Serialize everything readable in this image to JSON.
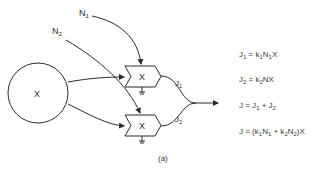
{
  "diagram": {
    "source_node": {
      "label": "X"
    },
    "inputs": [
      {
        "label": "N",
        "sub": "1"
      },
      {
        "label": "N",
        "sub": "2"
      }
    ],
    "multipliers": [
      {
        "label": "X"
      },
      {
        "label": "X"
      }
    ],
    "flows": [
      {
        "label": "J",
        "sub": "1"
      },
      {
        "label": "J",
        "sub": "2"
      }
    ],
    "caption": "(a)",
    "line_color": "#2a2a2a"
  },
  "equations": [
    {
      "lhs": "J",
      "lhs_sub": "1",
      "rhs_parts": [
        " = k",
        "1",
        "N",
        "1",
        "X"
      ]
    },
    {
      "lhs": "J",
      "lhs_sub": "2",
      "rhs_parts": " = k",
      "rhs_sub": "2",
      "rhs_tail": "NX"
    },
    {
      "text_a": "J = J",
      "sub_a": "1",
      "text_b": " + J",
      "sub_b": "2"
    },
    {
      "text_a": "J = (k",
      "sub_a": "1",
      "text_b": "N",
      "sub_b": "1",
      "text_c": " + k",
      "sub_c": "2",
      "text_d": "N",
      "sub_d": "2",
      "text_e": ")X"
    }
  ]
}
